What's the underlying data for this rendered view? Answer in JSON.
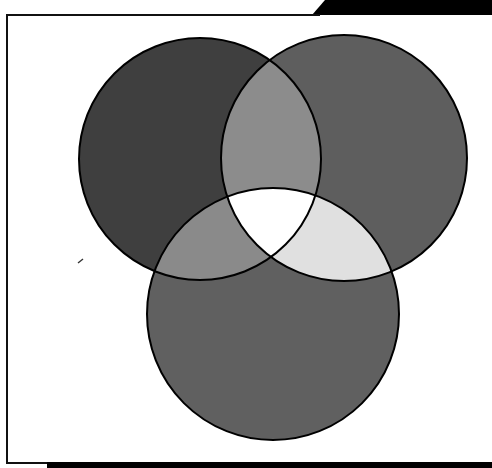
{
  "diagram": {
    "type": "venn",
    "title": "",
    "set_count": 3,
    "sets": [
      {
        "id": "left",
        "label": "",
        "cx": 200,
        "cy": 159,
        "r": 121,
        "color": "#3f3f3f"
      },
      {
        "id": "right",
        "label": "",
        "cx": 344,
        "cy": 158,
        "r": 123,
        "color": "#5e5e5e"
      },
      {
        "id": "bottom",
        "label": "",
        "cx": 273,
        "cy": 314,
        "r": 126,
        "color": "#606060"
      }
    ],
    "intersections": [
      {
        "sets": [
          "left",
          "right"
        ],
        "color": "#8c8c8c"
      },
      {
        "sets": [
          "left",
          "bottom"
        ],
        "color": "#8a8a8a"
      },
      {
        "sets": [
          "right",
          "bottom"
        ],
        "color": "#e0e0e0"
      },
      {
        "sets": [
          "left",
          "right",
          "bottom"
        ],
        "color": "#ffffff"
      }
    ],
    "outline_color": "#000000",
    "outline_width": 2
  },
  "frame": {
    "border_color": "#111111",
    "background": "#ffffff",
    "top_wedge_color": "#000000",
    "bottom_bar_color": "#000000"
  }
}
